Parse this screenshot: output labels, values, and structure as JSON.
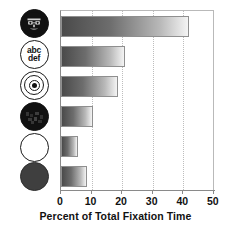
{
  "chart_data": {
    "type": "bar",
    "orientation": "horizontal",
    "title": "",
    "xlabel": "Percent of Total Fixation Time",
    "ylabel": "",
    "xlim": [
      0,
      50
    ],
    "xticks": [
      0,
      10,
      20,
      30,
      40,
      50
    ],
    "xtick_labels": [
      "0",
      "10",
      "20",
      "30",
      "40",
      "50"
    ],
    "grid": true,
    "grid_axis": "x",
    "grid_style": "dotted",
    "legend": "none",
    "categories": [
      "face",
      "abc-def-text",
      "bullseye-target",
      "scrambled-face",
      "empty-circle",
      "filled-gray-circle"
    ],
    "category_labels": [
      "",
      "abc def",
      "",
      "",
      "",
      ""
    ],
    "values": [
      42,
      21,
      18.5,
      10.5,
      5.5,
      8.5
    ],
    "bar_fill": "gradient dark-gray to white, left to right",
    "bar_border_color": "#8f8f8f"
  },
  "axis": {
    "tick_labels": [
      "0",
      "10",
      "20",
      "30",
      "40",
      "50"
    ],
    "x_axis_title": "Percent of Total Fixation Time"
  },
  "stimuli": [
    {
      "name": "face-icon",
      "label": "",
      "style": "dark circle with face"
    },
    {
      "name": "abc-def-text-icon",
      "line1": "abc",
      "line2": "def",
      "style": "white circle with text"
    },
    {
      "name": "bullseye-target-icon",
      "label": "",
      "style": "concentric rings"
    },
    {
      "name": "scrambled-face-icon",
      "label": "",
      "style": "solid black circle"
    },
    {
      "name": "empty-circle-icon",
      "label": "",
      "style": "white outlined circle"
    },
    {
      "name": "filled-gray-circle-icon",
      "label": "",
      "style": "solid gray circle"
    }
  ],
  "colors": {
    "background": "#ffffff",
    "bar_dark": "#4a4a4a",
    "bar_light": "#f4f4f4",
    "axis": "#8a8a8a",
    "grid": "#bdbdbd",
    "text": "#111111"
  }
}
